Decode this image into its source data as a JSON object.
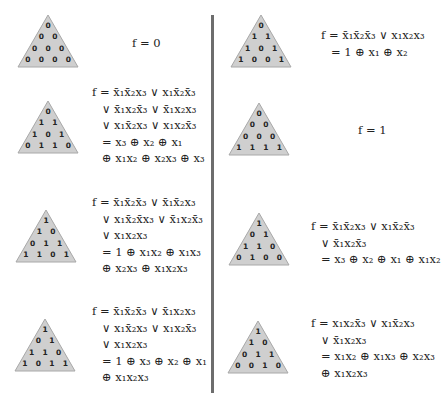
{
  "colors": {
    "triangle_fill": "#cfcfcf",
    "triangle_stroke": "#a8a8a8",
    "separator": "#6d6d6d",
    "text": "#222222"
  },
  "left": [
    {
      "triangle": [
        [
          "0"
        ],
        [
          "0",
          "0"
        ],
        [
          "0",
          "0",
          "0"
        ],
        [
          "0",
          "0",
          "0",
          "0"
        ]
      ],
      "formula": [
        "f = 0"
      ]
    },
    {
      "triangle": [
        [
          "0"
        ],
        [
          "1",
          "1"
        ],
        [
          "1",
          "0",
          "1"
        ],
        [
          "0",
          "1",
          "1",
          "0"
        ]
      ],
      "formula": [
        "f = x̄₁x̄₂x₃ ∨ x₁x̄₂x̄₃",
        "∨ x̄₁x₂x̄₃ ∨ x̄₁x₂x₃",
        "∨ x₁x̄₂x₃ ∨ x₁x₂x̄₃",
        "= x₃ ⊕ x₂ ⊕ x₁",
        "⊕ x₁x₂ ⊕ x₂x₃ ⊕ x₃"
      ]
    },
    {
      "triangle": [
        [
          "1"
        ],
        [
          "1",
          "0"
        ],
        [
          "0",
          "1",
          "1"
        ],
        [
          "1",
          "1",
          "0",
          "1"
        ]
      ],
      "formula": [
        "f = x̄₁x̄₂x̄₃ ∨ x̄₁x̄₂x₃",
        "∨ x₁x̄₂x̄x₃ ∨ x̄₁x₂x̄₃",
        "∨ x₁x₂x₃",
        "= 1 ⊕ x₁x₂ ⊕ x₁x₃",
        "⊕ x₂x₃ ⊕ x₁x₂x₃"
      ]
    },
    {
      "triangle": [
        [
          "1"
        ],
        [
          "0",
          "1"
        ],
        [
          "1",
          "1",
          "0"
        ],
        [
          "1",
          "0",
          "1",
          "1"
        ]
      ],
      "formula": [
        "f = x̄₁x̄₂x̄₃ ∨ x̄₁x₂x₃",
        "∨ x₁x̄₂x₃ ∨ x₁x₂x̄₃",
        "∨ x₁x₂x₃",
        "= 1 ⊕ x₃ ⊕ x₂ ⊕ x₁",
        "⊕ x₁x₂x₃"
      ]
    }
  ],
  "right": [
    {
      "triangle": [
        [
          "0"
        ],
        [
          "1",
          "1"
        ],
        [
          "1",
          "0",
          "1"
        ],
        [
          "1",
          "0",
          "0",
          "1"
        ]
      ],
      "formula": [
        "f = x̄₁x̄₂x̄₃ ∨ x₁x₂x₃",
        "= 1 ⊕ x₁ ⊕ x₂"
      ]
    },
    {
      "triangle": [
        [
          "0"
        ],
        [
          "0",
          "0"
        ],
        [
          "0",
          "0",
          "0"
        ],
        [
          "1",
          "1",
          "1",
          "1"
        ]
      ],
      "formula": [
        "f = 1"
      ]
    },
    {
      "triangle": [
        [
          "1"
        ],
        [
          "0",
          "1"
        ],
        [
          "1",
          "1",
          "0"
        ],
        [
          "0",
          "1",
          "0",
          "0"
        ]
      ],
      "formula": [
        "f = x̄₁x̄₂x₃ ∨ x₁x̄₂x̄₃",
        "∨ x̄₁x₂x̄₃",
        "= x₃ ⊕ x₂ ⊕ x₁ ⊕ x₁x₂"
      ]
    },
    {
      "triangle": [
        [
          "1"
        ],
        [
          "1",
          "0"
        ],
        [
          "0",
          "1",
          "1"
        ],
        [
          "0",
          "0",
          "1",
          "0"
        ]
      ],
      "formula": [
        "f = x₁x₂x̄₃ ∨ x₁x̄₂x₃",
        "∨ x̄₁x₂x₃",
        "= x₁x₂ ⊕ x₁x₃ ⊕ x₂x₃",
        "⊕ x₁x₂x₃"
      ]
    }
  ]
}
